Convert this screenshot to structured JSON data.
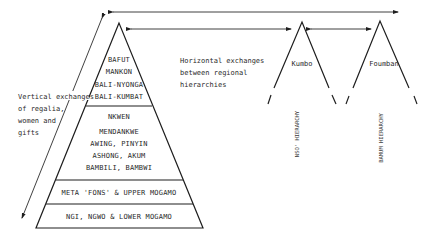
{
  "diagram": {
    "main_pyramid": {
      "tiers": [
        {
          "name": "top",
          "lines": [
            "BAFUT",
            "MANKON",
            "BALI-NYONGA",
            "BALI-KUMBAT"
          ]
        },
        {
          "name": "middle",
          "lines": [
            "NKWEN",
            "MENDANKWE",
            "AWING, PINYIN",
            "ASHONG, AKUM",
            "BAMBILI, BAMBWI"
          ]
        },
        {
          "name": "lower",
          "lines": [
            "META 'FONS' & UPPER MOGAMO"
          ]
        },
        {
          "name": "bottom",
          "lines": [
            "NGI, NGWO & LOWER MOGAMO"
          ]
        }
      ]
    },
    "vertical_note": [
      "Vertical exchanges",
      "of regalia,",
      "women and",
      "gifts"
    ],
    "horizontal_note": [
      "Horizontal exchanges",
      "between regional",
      "hierarchies"
    ],
    "regional_hierarchies": [
      {
        "place": "Kumbo",
        "label": "NSO' HIERARCHY"
      },
      {
        "place": "Foumban",
        "label": "BAMUM HIERARCHY"
      }
    ],
    "colors": {
      "ink": "#1e1e1e",
      "background": "#ffffff"
    }
  }
}
